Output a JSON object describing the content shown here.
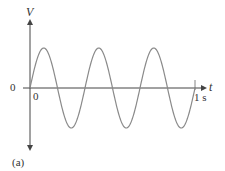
{
  "chart_data": {
    "type": "line",
    "title": "",
    "xlabel": "t",
    "ylabel": "V",
    "x_tick_labels": [
      "0",
      "1 s"
    ],
    "y_tick_labels": [
      "0"
    ],
    "caption": "(a)",
    "series": [
      {
        "name": "V(t)",
        "function": "sine",
        "cycles": 3,
        "period_s": 0.3333,
        "x": [
          0,
          0.0833,
          0.1667,
          0.25,
          0.3333,
          0.4167,
          0.5,
          0.5833,
          0.6667,
          0.75,
          0.8333,
          0.9167,
          1.0
        ],
        "values": [
          0,
          1,
          0,
          -1,
          0,
          1,
          0,
          -1,
          0,
          1,
          0,
          -1,
          0
        ]
      }
    ],
    "xlim": [
      0,
      1
    ],
    "ylim": [
      -1,
      1
    ],
    "grid": false,
    "colors": {
      "axis": "#444444",
      "curve": "#8a8a8a"
    }
  },
  "labels": {
    "v_axis": "V",
    "t_axis": "t",
    "origin_left": "0",
    "origin_below": "0",
    "end_time": "1 s",
    "caption": "(a)"
  }
}
